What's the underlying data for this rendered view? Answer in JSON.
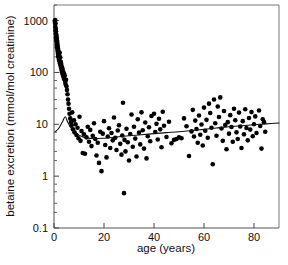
{
  "chart_data": {
    "type": "scatter",
    "title": "",
    "xlabel": "age (years)",
    "ylabel": "betaine excretion (mmol/mol creatinine)",
    "xlim": [
      0,
      90
    ],
    "ylim": [
      0.1,
      2000
    ],
    "yscale": "log",
    "xscale": "linear",
    "grid": false,
    "legend": null,
    "xticks": [
      0,
      20,
      40,
      60,
      80
    ],
    "xticklabels": [
      "0",
      "20",
      "40",
      "60",
      "80"
    ],
    "yticks": [
      0.1,
      1,
      10,
      100,
      1000
    ],
    "yticklabels": [
      "0.1",
      "1",
      "10",
      "100",
      "1000"
    ],
    "yminorticks": [
      0.2,
      0.3,
      0.5,
      0.7,
      2,
      3,
      5,
      7,
      20,
      30,
      50,
      70,
      200,
      300,
      500,
      700,
      2000
    ],
    "marker": "filled-circle",
    "marker_color": "#000000",
    "series": [
      {
        "name": "betaine excretion",
        "points": [
          [
            0.3,
            980
          ],
          [
            0.4,
            900
          ],
          [
            0.5,
            1020
          ],
          [
            0.5,
            760
          ],
          [
            0.6,
            880
          ],
          [
            0.6,
            640
          ],
          [
            0.7,
            700
          ],
          [
            0.7,
            560
          ],
          [
            0.8,
            620
          ],
          [
            0.8,
            480
          ],
          [
            0.9,
            540
          ],
          [
            0.9,
            430
          ],
          [
            1.0,
            500
          ],
          [
            1.0,
            390
          ],
          [
            1.1,
            450
          ],
          [
            1.1,
            350
          ],
          [
            1.2,
            410
          ],
          [
            1.2,
            320
          ],
          [
            1.3,
            380
          ],
          [
            1.3,
            300
          ],
          [
            1.4,
            340
          ],
          [
            1.4,
            275
          ],
          [
            1.5,
            310
          ],
          [
            1.5,
            250
          ],
          [
            1.6,
            290
          ],
          [
            1.6,
            230
          ],
          [
            1.7,
            265
          ],
          [
            1.7,
            210
          ],
          [
            1.8,
            245
          ],
          [
            1.8,
            195
          ],
          [
            1.9,
            225
          ],
          [
            2.0,
            205
          ],
          [
            2.0,
            175
          ],
          [
            2.1,
            190
          ],
          [
            2.2,
            165
          ],
          [
            2.3,
            240
          ],
          [
            2.4,
            150
          ],
          [
            2.5,
            195
          ],
          [
            2.6,
            138
          ],
          [
            2.7,
            160
          ],
          [
            2.8,
            125
          ],
          [
            2.9,
            145
          ],
          [
            3.0,
            112
          ],
          [
            3.1,
            130
          ],
          [
            3.2,
            100
          ],
          [
            3.4,
            118
          ],
          [
            3.5,
            90
          ],
          [
            3.6,
            105
          ],
          [
            3.8,
            82
          ],
          [
            4.0,
            95
          ],
          [
            4.1,
            74
          ],
          [
            4.3,
            86
          ],
          [
            4.5,
            66
          ],
          [
            4.6,
            60
          ],
          [
            4.8,
            72
          ],
          [
            5.0,
            54
          ],
          [
            5.2,
            46
          ],
          [
            5.4,
            38
          ],
          [
            5.6,
            30
          ],
          [
            5.8,
            25
          ],
          [
            6.0,
            20
          ],
          [
            6.2,
            16
          ],
          [
            6.5,
            13
          ],
          [
            6.8,
            11
          ],
          [
            7.0,
            9.5
          ],
          [
            7.3,
            17
          ],
          [
            7.6,
            8.0
          ],
          [
            8.0,
            12
          ],
          [
            8.2,
            7.0
          ],
          [
            8.6,
            10
          ],
          [
            9.0,
            6.2
          ],
          [
            9.4,
            8.6
          ],
          [
            9.8,
            5.4
          ],
          [
            10.2,
            14
          ],
          [
            10.6,
            4.8
          ],
          [
            11.0,
            7.4
          ],
          [
            11.5,
            2.8
          ],
          [
            12.0,
            6.4
          ],
          [
            12.4,
            2.7
          ],
          [
            13.0,
            5.6
          ],
          [
            13.5,
            9.0
          ],
          [
            14.0,
            4.6
          ],
          [
            14.5,
            7.8
          ],
          [
            15.0,
            3.8
          ],
          [
            15.5,
            6.0
          ],
          [
            16.0,
            10.5
          ],
          [
            16.5,
            5.2
          ],
          [
            17.0,
            2.5
          ],
          [
            17.5,
            4.4
          ],
          [
            18.0,
            1.8
          ],
          [
            18.5,
            7.2
          ],
          [
            19.0,
            1.25
          ],
          [
            19.5,
            6.6
          ],
          [
            20.0,
            11.5
          ],
          [
            20.5,
            4.0
          ],
          [
            21.0,
            2.3
          ],
          [
            21.5,
            5.8
          ],
          [
            22.0,
            8.4
          ],
          [
            22.5,
            3.5
          ],
          [
            23.0,
            6.8
          ],
          [
            23.5,
            4.9
          ],
          [
            24.0,
            13.5
          ],
          [
            24.5,
            5.5
          ],
          [
            25.0,
            3.2
          ],
          [
            25.5,
            7.6
          ],
          [
            26.0,
            9.6
          ],
          [
            26.5,
            4.2
          ],
          [
            27.0,
            2.6
          ],
          [
            27.3,
            6.1
          ],
          [
            27.6,
            26
          ],
          [
            28.0,
            0.47
          ],
          [
            28.2,
            5.0
          ],
          [
            28.6,
            3.0
          ],
          [
            29.0,
            8.2
          ],
          [
            29.5,
            4.5
          ],
          [
            30.0,
            2.0
          ],
          [
            30.5,
            6.5
          ],
          [
            31.0,
            15.5
          ],
          [
            31.5,
            3.7
          ],
          [
            32.0,
            9.0
          ],
          [
            32.5,
            5.3
          ],
          [
            33.0,
            2.4
          ],
          [
            33.5,
            12.5
          ],
          [
            34.0,
            6.9
          ],
          [
            34.5,
            4.1
          ],
          [
            35.0,
            17
          ],
          [
            35.5,
            7.7
          ],
          [
            36.0,
            3.4
          ],
          [
            36.5,
            10.8
          ],
          [
            37.0,
            2.2
          ],
          [
            37.5,
            5.9
          ],
          [
            38.0,
            8.8
          ],
          [
            38.5,
            4.7
          ],
          [
            39.0,
            14.5
          ],
          [
            40.0,
            16
          ],
          [
            40.5,
            7.1
          ],
          [
            41.0,
            10.2
          ],
          [
            41.5,
            5.1
          ],
          [
            42.0,
            12.8
          ],
          [
            42.5,
            8.0
          ],
          [
            43.0,
            3.6
          ],
          [
            43.5,
            17.5
          ],
          [
            44.0,
            9.4
          ],
          [
            45.0,
            5.7
          ],
          [
            46.0,
            11.2
          ],
          [
            47.0,
            4.3
          ],
          [
            48.0,
            5.0
          ],
          [
            49.0,
            5.2
          ],
          [
            50.0,
            5.6
          ],
          [
            51.0,
            5.4
          ],
          [
            52.0,
            13.0
          ],
          [
            53.0,
            9.2
          ],
          [
            54.0,
            2.45
          ],
          [
            55.0,
            7.3
          ],
          [
            55.5,
            19
          ],
          [
            56.0,
            5.8
          ],
          [
            56.5,
            11.8
          ],
          [
            57.0,
            8.1
          ],
          [
            57.5,
            4.4
          ],
          [
            58.0,
            14.8
          ],
          [
            58.5,
            6.3
          ],
          [
            59.0,
            9.9
          ],
          [
            59.5,
            3.9
          ],
          [
            60.0,
            21
          ],
          [
            60.5,
            7.5
          ],
          [
            61.0,
            12.2
          ],
          [
            61.5,
            5.5
          ],
          [
            62.0,
            25
          ],
          [
            62.5,
            16.5
          ],
          [
            63.0,
            8.6
          ],
          [
            63.5,
            1.7
          ],
          [
            64.0,
            30
          ],
          [
            64.5,
            10.5
          ],
          [
            65.0,
            6.0
          ],
          [
            65.5,
            22
          ],
          [
            66.0,
            13.8
          ],
          [
            66.5,
            33
          ],
          [
            67.0,
            8.3
          ],
          [
            67.5,
            4.8
          ],
          [
            68.0,
            18
          ],
          [
            68.5,
            9.7
          ],
          [
            69.0,
            3.3
          ],
          [
            69.5,
            11.0
          ],
          [
            70.0,
            6.6
          ],
          [
            70.5,
            15.0
          ],
          [
            71.0,
            8.9
          ],
          [
            71.5,
            4.6
          ],
          [
            72.0,
            20
          ],
          [
            72.5,
            12.0
          ],
          [
            73.0,
            7.0
          ],
          [
            73.5,
            5.2
          ],
          [
            74.0,
            16.8
          ],
          [
            74.5,
            9.1
          ],
          [
            75.0,
            3.5
          ],
          [
            75.5,
            11.5
          ],
          [
            76.0,
            6.4
          ],
          [
            76.5,
            19.5
          ],
          [
            77.0,
            8.5
          ],
          [
            77.5,
            4.9
          ],
          [
            78.0,
            13.2
          ],
          [
            78.5,
            7.9
          ],
          [
            79.0,
            17.2
          ],
          [
            79.5,
            5.9
          ],
          [
            80.0,
            10.0
          ],
          [
            80.5,
            14.2
          ],
          [
            81.0,
            6.8
          ],
          [
            82.0,
            18.5
          ],
          [
            82.5,
            9.3
          ],
          [
            83.0,
            3.4
          ],
          [
            83.5,
            12.5
          ],
          [
            84.0,
            11.0
          ],
          [
            84.5,
            7.2
          ]
        ]
      }
    ],
    "trend_line": {
      "name": "fitted curve",
      "points": [
        [
          0.5,
          7.2
        ],
        [
          2.0,
          8.5
        ],
        [
          3.5,
          11.5
        ],
        [
          4.5,
          14.0
        ],
        [
          5.5,
          11.0
        ],
        [
          7.0,
          8.2
        ],
        [
          9.0,
          6.6
        ],
        [
          12.0,
          5.6
        ],
        [
          16.0,
          5.3
        ],
        [
          20.0,
          5.4
        ],
        [
          25.0,
          5.7
        ],
        [
          30.0,
          6.0
        ],
        [
          35.0,
          6.3
        ],
        [
          40.0,
          6.6
        ],
        [
          45.0,
          6.9
        ],
        [
          50.0,
          7.2
        ],
        [
          55.0,
          7.6
        ],
        [
          60.0,
          8.0
        ],
        [
          65.0,
          8.5
        ],
        [
          70.0,
          9.0
        ],
        [
          75.0,
          9.4
        ],
        [
          80.0,
          9.8
        ],
        [
          85.0,
          10.2
        ],
        [
          90.0,
          10.6
        ]
      ]
    }
  },
  "axes": {
    "x_title": "age (years)",
    "y_title": "betaine excretion (mmol/mol creatinine)"
  }
}
